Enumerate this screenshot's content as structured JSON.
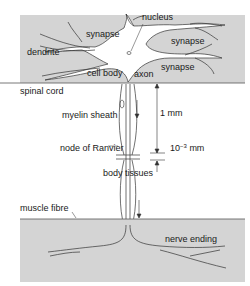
{
  "diagram": {
    "regions": {
      "spinal_cord": "spinal cord",
      "body_tissues": "body tissues",
      "muscle_fibre": "muscle fibre"
    },
    "labels": {
      "nucleus": "nucleus",
      "synapse_1": "synapse",
      "synapse_2": "synapse",
      "synapse_3": "synapse",
      "dendrite": "dendrite",
      "cell_body": "cell body",
      "axon": "axon",
      "myelin_sheath": "myelin sheath",
      "node_of_ranvier": "node of Ranvier",
      "nerve_ending": "nerve ending"
    },
    "dimensions": {
      "internode_length": "1 mm",
      "node_gap_base": "10",
      "node_gap_exp": "−3",
      "node_gap_unit": "mm"
    },
    "colors": {
      "tissue_fill": "#d4d4d4",
      "neuron_fill": "#ffffff",
      "line": "#333333"
    }
  }
}
